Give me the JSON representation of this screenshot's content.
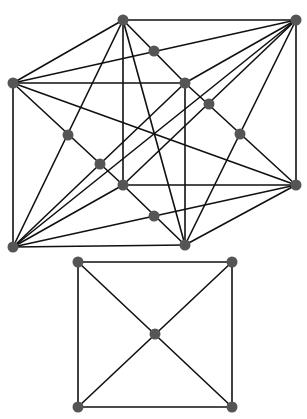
{
  "diagram": {
    "colors": {
      "edge": "#111111",
      "node": "#555555",
      "background": "#ffffff"
    },
    "top_figure": {
      "nodes": {
        "A": [
          123,
          20
        ],
        "B": [
          296,
          20
        ],
        "C": [
          13,
          83
        ],
        "D": [
          185,
          83
        ],
        "E": [
          123,
          185
        ],
        "F": [
          296,
          185
        ],
        "G": [
          13,
          247
        ],
        "H": [
          185,
          245
        ],
        "M1": [
          154,
          51
        ],
        "M2": [
          209,
          104
        ],
        "M3": [
          240,
          134
        ],
        "M4": [
          68,
          135
        ],
        "M5": [
          100,
          164
        ],
        "M6": [
          154,
          216
        ]
      },
      "edges": [
        [
          "A",
          "B"
        ],
        [
          "C",
          "D"
        ],
        [
          "E",
          "F"
        ],
        [
          "G",
          "H"
        ],
        [
          "A",
          "C"
        ],
        [
          "B",
          "D"
        ],
        [
          "E",
          "G"
        ],
        [
          "F",
          "H"
        ],
        [
          "A",
          "E"
        ],
        [
          "B",
          "F"
        ],
        [
          "C",
          "G"
        ],
        [
          "D",
          "H"
        ],
        [
          "A",
          "D"
        ],
        [
          "C",
          "B"
        ],
        [
          "A",
          "G"
        ],
        [
          "C",
          "E"
        ],
        [
          "B",
          "H"
        ],
        [
          "D",
          "F"
        ],
        [
          "E",
          "H"
        ],
        [
          "G",
          "F"
        ],
        [
          "B",
          "E"
        ],
        [
          "G",
          "D"
        ],
        [
          "A",
          "H"
        ],
        [
          "C",
          "F"
        ],
        [
          "B",
          "G"
        ]
      ]
    },
    "bottom_figure": {
      "nodes": {
        "P1": [
          78,
          262
        ],
        "P2": [
          232,
          262
        ],
        "P3": [
          78,
          407
        ],
        "P4": [
          232,
          407
        ],
        "PC": [
          155,
          334
        ]
      },
      "edges": [
        [
          "P1",
          "P2"
        ],
        [
          "P2",
          "P4"
        ],
        [
          "P4",
          "P3"
        ],
        [
          "P3",
          "P1"
        ],
        [
          "P1",
          "P4"
        ],
        [
          "P2",
          "P3"
        ]
      ]
    }
  }
}
